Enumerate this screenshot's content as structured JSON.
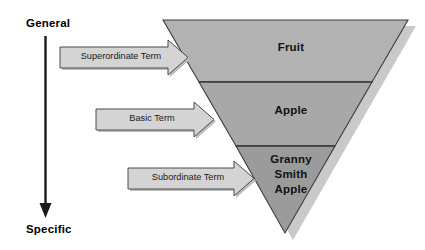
{
  "figure": {
    "type": "hierarchy-diagram",
    "orientation": "inverted-triangle",
    "background": "#ffffff"
  },
  "axis": {
    "top_label": "General",
    "bottom_label": "Specific",
    "arrow_direction": "down",
    "arrow_color": "#1a1a1a"
  },
  "tiers": [
    {
      "label": "Fruit",
      "level": "superordinate",
      "fill": "#b2b2b2"
    },
    {
      "label": "Apple",
      "level": "basic",
      "fill": "#a8a8a8"
    },
    {
      "label": "Granny\nSmith\nApple",
      "level": "subordinate",
      "fill": "#9b9b9b",
      "lines": [
        "Granny",
        "Smith",
        "Apple"
      ]
    }
  ],
  "banners": [
    {
      "label": "Superordinate Term",
      "fill": "#d4d4d4",
      "stroke": "#4a4a4a"
    },
    {
      "label": "Basic Term",
      "fill": "#d4d4d4",
      "stroke": "#4a4a4a"
    },
    {
      "label": "Subordinate Term",
      "fill": "#d4d4d4",
      "stroke": "#4a4a4a"
    }
  ],
  "colors": {
    "shadow": "#c9c9c9",
    "outline": "#3c3c3c",
    "divider": "#2e2e2e",
    "text": "#000000"
  }
}
